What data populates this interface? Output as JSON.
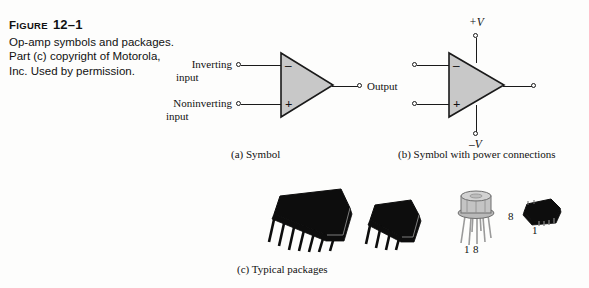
{
  "figure": {
    "label_word": "Figure",
    "number": "12–1",
    "caption_lines": [
      "Op-amp symbols and packages.",
      "Part (c) copyright of Motorola,",
      "Inc. Used by permission."
    ]
  },
  "colors": {
    "page_background": "#fdfdfc",
    "ink": "#1a1a1a",
    "triangle_fill": "#c8c8c8",
    "package_body": "#0d0d0d",
    "can_metal": "#b9b9b9"
  },
  "diagram_a": {
    "subcaption": "(a) Symbol",
    "inverting_label_line1": "Inverting",
    "inverting_label_line2": "input",
    "noninverting_label_line1": "Noninverting",
    "noninverting_label_line2": "input",
    "output_label": "Output",
    "minus_sign": "–",
    "plus_sign": "+"
  },
  "diagram_b": {
    "subcaption": "(b) Symbol with power connections",
    "positive_supply_label": "+V",
    "negative_supply_label": "–V",
    "minus_sign": "–",
    "plus_sign": "+"
  },
  "diagram_c": {
    "subcaption": "(c) Typical packages",
    "packages": [
      {
        "name": "dip-14-pin",
        "pin_count": 14
      },
      {
        "name": "dip-8-pin",
        "pin_count": 8
      },
      {
        "name": "to-can-8-pin",
        "pin_count": 8,
        "pin_label_left": "1",
        "pin_label_right": "8"
      },
      {
        "name": "soic-8-pin",
        "pin_count": 8,
        "pin_label_left": "8",
        "pin_label_bottom": "1"
      }
    ]
  }
}
